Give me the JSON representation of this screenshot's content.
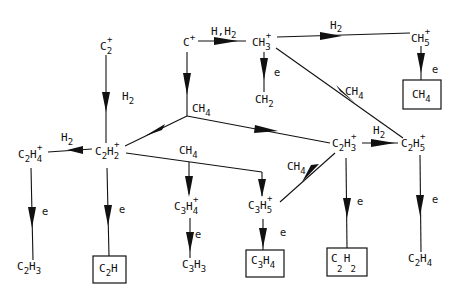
{
  "diagram": {
    "type": "reaction-network",
    "nodes": {
      "c2p": {
        "base": "C",
        "sub": "2",
        "sup": "+"
      },
      "cp": {
        "base": "C",
        "sub": "",
        "sup": "+"
      },
      "ch3p": {
        "base": "CH",
        "sub": "3",
        "sup": "+"
      },
      "ch5p": {
        "base": "CH",
        "sub": "5",
        "sup": "+"
      },
      "ch4_box": {
        "base": "CH",
        "sub": "4",
        "sup": "",
        "boxed": true
      },
      "ch2": {
        "base": "CH",
        "sub": "2",
        "sup": ""
      },
      "c2h4p": {
        "b1": "C",
        "s1": "2",
        "b2": "H",
        "s2": "4",
        "sup": "+"
      },
      "c2h2p": {
        "b1": "C",
        "s1": "2",
        "b2": "H",
        "s2": "2",
        "sup": "+"
      },
      "c2h3p": {
        "b1": "C",
        "s1": "2",
        "b2": "H",
        "s2": "3",
        "sup": "+"
      },
      "c2h5p": {
        "b1": "C",
        "s1": "2",
        "b2": "H",
        "s2": "5",
        "sup": "+"
      },
      "c3h4p": {
        "b1": "C",
        "s1": "3",
        "b2": "H",
        "s2": "4",
        "sup": "+"
      },
      "c3h5p": {
        "b1": "C",
        "s1": "3",
        "b2": "H",
        "s2": "5",
        "sup": "+"
      },
      "c2h3": {
        "b1": "C",
        "s1": "2",
        "b2": "H",
        "s2": "3",
        "sup": ""
      },
      "c2h_box": {
        "b1": "C",
        "s1": "2",
        "b2": "H",
        "s2": "",
        "sup": "",
        "boxed": true
      },
      "c3h3": {
        "b1": "C",
        "s1": "3",
        "b2": "H",
        "s2": "3",
        "sup": ""
      },
      "c3h4_box": {
        "b1": "C",
        "s1": "3",
        "b2": "H",
        "s2": "4",
        "sup": "",
        "boxed": true
      },
      "c2h2_box": {
        "b1": "C",
        "s1": "2",
        "b2": "H",
        "s2": "2",
        "sup": "",
        "boxed": true
      },
      "c2h4": {
        "b1": "C",
        "s1": "2",
        "b2": "H",
        "s2": "4",
        "sup": ""
      }
    },
    "edge_labels": {
      "h_h2": "H,H",
      "h_h2_sub": "2",
      "h2": "H",
      "h2_sub": "2",
      "ch4": "CH",
      "ch4_sub": "4",
      "e": "e"
    },
    "edges": [
      {
        "from": "C+",
        "to": "CH3+",
        "label": "H,H2"
      },
      {
        "from": "CH3+",
        "to": "CH5+",
        "label": "H2"
      },
      {
        "from": "CH5+",
        "to": "CH4",
        "label": "e"
      },
      {
        "from": "CH3+",
        "to": "CH2",
        "label": "e"
      },
      {
        "from": "CH3+",
        "to": "C2H5+",
        "label": "CH4"
      },
      {
        "from": "C+",
        "to": "CH4 junction",
        "label": "CH4"
      },
      {
        "from": "CH4 junction",
        "to": "C2H2+",
        "label": ""
      },
      {
        "from": "CH4 junction",
        "to": "C2H3+",
        "label": ""
      },
      {
        "from": "C2+",
        "to": "C2H2+",
        "label": "H2"
      },
      {
        "from": "C2H2+",
        "to": "C2H4+",
        "label": "H2"
      },
      {
        "from": "C2H4+",
        "to": "C2H3",
        "label": "e"
      },
      {
        "from": "C2H2+",
        "to": "C2H",
        "label": "e"
      },
      {
        "from": "C2H2+",
        "to": "C3H4+",
        "label": "CH4"
      },
      {
        "from": "C2H2+",
        "to": "C3H5+",
        "label": "CH4"
      },
      {
        "from": "C3H4+",
        "to": "C3H3",
        "label": "e"
      },
      {
        "from": "C2H3+",
        "to": "C2H5+",
        "label": "H2"
      },
      {
        "from": "C2H3+",
        "to": "C3H5+",
        "label": "CH4"
      },
      {
        "from": "C3H5+",
        "to": "C3H4",
        "label": "e"
      },
      {
        "from": "C2H3+",
        "to": "C2H2",
        "label": "e"
      },
      {
        "from": "C2H5+",
        "to": "C2H4",
        "label": "e"
      }
    ]
  }
}
